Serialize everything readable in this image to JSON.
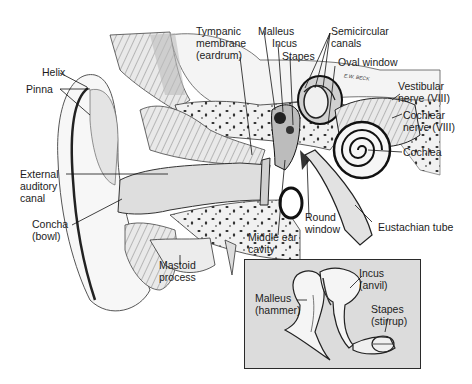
{
  "figure": {
    "artist_signature": "E.W. BECK",
    "colors": {
      "background": "#ffffff",
      "line": "#1c1c1c",
      "inset_fill": "#dcdcdc",
      "tissue": "#e6e6e6"
    }
  },
  "labels": {
    "helix": "Helix",
    "pinna": "Pinna",
    "external_auditory_canal": [
      "External",
      "auditory",
      "canal"
    ],
    "concha": [
      "Concha",
      "(bowl)"
    ],
    "mastoid_process": [
      "Mastoid",
      "process"
    ],
    "tympanic_membrane": [
      "Tympanic",
      "membrane",
      "(eardrum)"
    ],
    "malleus": "Malleus",
    "incus": "Incus",
    "stapes": "Stapes",
    "semicircular_canals": [
      "Semicircular",
      "canals"
    ],
    "oval_window": "Oval window",
    "vestibular_nerve": [
      "Vestibular",
      "nerve (VIII)"
    ],
    "cochlear_nerve": [
      "Cochlear",
      "nerve (VIII)"
    ],
    "cochlea": "Cochlea",
    "round_window": [
      "Round",
      "window"
    ],
    "eustachian_tube": "Eustachian tube",
    "middle_ear_cavity": [
      "Middle ear",
      "cavity"
    ]
  },
  "inset": {
    "title": "Ossicles",
    "labels": {
      "malleus": [
        "Malleus",
        "(hammer)"
      ],
      "incus": [
        "Incus",
        "(anvil)"
      ],
      "stapes": [
        "Stapes",
        "(stirrup)"
      ]
    }
  }
}
